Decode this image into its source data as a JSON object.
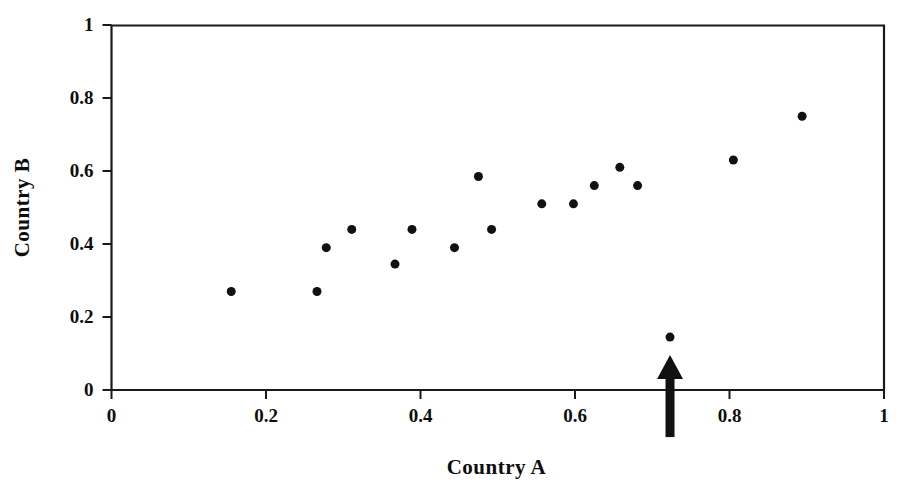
{
  "chart_data": {
    "type": "scatter",
    "title": "",
    "xlabel": "Country A",
    "ylabel": "Country B",
    "xlim": [
      0,
      1
    ],
    "ylim": [
      0,
      1
    ],
    "xticks": [
      0,
      0.2,
      0.4,
      0.6,
      0.8,
      1
    ],
    "ytricks_note": "",
    "yticks": [
      0,
      0.2,
      0.4,
      0.6,
      0.8,
      1
    ],
    "xtick_labels": [
      "0",
      "0.2",
      "0.4",
      "0.6",
      "0.8",
      "1"
    ],
    "ytick_labels": [
      "0",
      "0.2",
      "0.4",
      "0.6",
      "0.8",
      "1"
    ],
    "grid": false,
    "legend": null,
    "marker": {
      "shape": "circle",
      "color": "#111111",
      "size_px": 9
    },
    "points": [
      {
        "x": 0.155,
        "y": 0.27
      },
      {
        "x": 0.266,
        "y": 0.27
      },
      {
        "x": 0.278,
        "y": 0.39
      },
      {
        "x": 0.311,
        "y": 0.44
      },
      {
        "x": 0.367,
        "y": 0.345
      },
      {
        "x": 0.389,
        "y": 0.44
      },
      {
        "x": 0.444,
        "y": 0.39
      },
      {
        "x": 0.475,
        "y": 0.585
      },
      {
        "x": 0.492,
        "y": 0.44
      },
      {
        "x": 0.557,
        "y": 0.51
      },
      {
        "x": 0.598,
        "y": 0.51
      },
      {
        "x": 0.625,
        "y": 0.56
      },
      {
        "x": 0.658,
        "y": 0.61
      },
      {
        "x": 0.681,
        "y": 0.56
      },
      {
        "x": 0.805,
        "y": 0.63
      },
      {
        "x": 0.894,
        "y": 0.75
      },
      {
        "x": 0.723,
        "y": 0.145
      }
    ],
    "annotations": [
      {
        "type": "arrow",
        "shape": "up-arrow",
        "color": "#111111",
        "x": 0.723,
        "y_tip": 0.096,
        "y_tail": -0.129,
        "label": ""
      }
    ]
  },
  "axes": {
    "x_title": "Country A",
    "y_title": "Country B"
  }
}
